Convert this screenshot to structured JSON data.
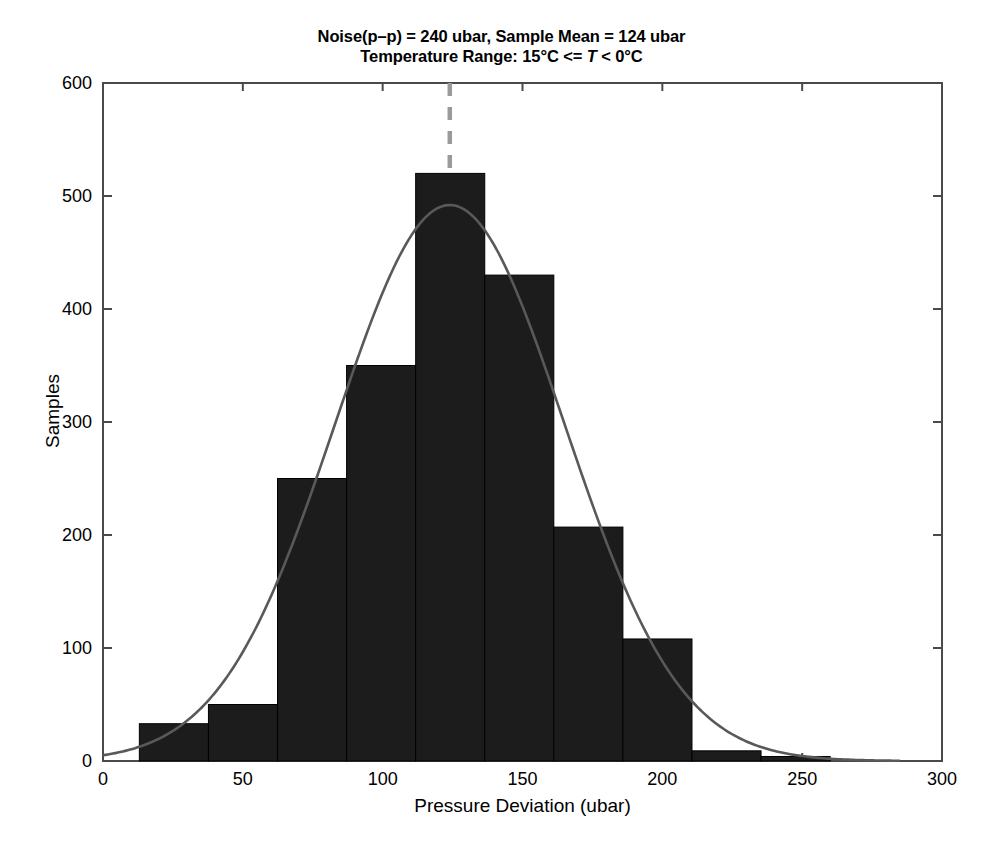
{
  "chart_data": {
    "type": "bar",
    "title": "Noise(p–p) = 240 ubar, Sample Mean = 124 ubar\nTemperature Range: 15°C <= T < 0°C",
    "title_lines": [
      "Noise(p–p) = 240 ubar, Sample Mean = 124 ubar",
      "Temperature Range: 15°C <= T < 0°C"
    ],
    "title_line2_parts": {
      "before": "Temperature Range: 15°C <= ",
      "italic": "T",
      "after": " < 0°C"
    },
    "xlabel": "Pressure Deviation (ubar)",
    "ylabel": "Samples",
    "xlim": [
      0,
      300
    ],
    "ylim": [
      0,
      600
    ],
    "xticks": [
      0,
      50,
      100,
      150,
      200,
      250,
      300
    ],
    "yticks": [
      0,
      100,
      200,
      300,
      400,
      500,
      600
    ],
    "grid": false,
    "legend": null,
    "bar_color": "#1c1c1c",
    "curve_color": "#595959",
    "mean_line_color": "#9a9a9a",
    "bin_width": 24.7,
    "bin_edges": [
      13,
      37.7,
      62.4,
      87.1,
      111.8,
      136.5,
      161.2,
      185.9,
      210.6,
      235.3,
      260.0
    ],
    "bin_centers": [
      25.4,
      50.1,
      74.8,
      99.5,
      124.2,
      148.9,
      173.6,
      198.3,
      223.0,
      247.7
    ],
    "values": [
      33,
      50,
      250,
      350,
      520,
      430,
      207,
      108,
      9,
      4
    ],
    "annotations": {
      "mean_line_x": 124,
      "mean_line_style": "dashed",
      "fit_curve": "gaussian",
      "fit_mean": 124,
      "fit_sigma": 41,
      "fit_peak": 492,
      "noise_p_p": 240,
      "sample_mean": 124,
      "temperature_range_low": "15°C",
      "temperature_range_high": "0°C"
    }
  },
  "axes": {
    "xtick_labels": [
      "0",
      "50",
      "100",
      "150",
      "200",
      "250",
      "300"
    ],
    "ytick_labels": [
      "0",
      "100",
      "200",
      "300",
      "400",
      "500",
      "600"
    ]
  }
}
